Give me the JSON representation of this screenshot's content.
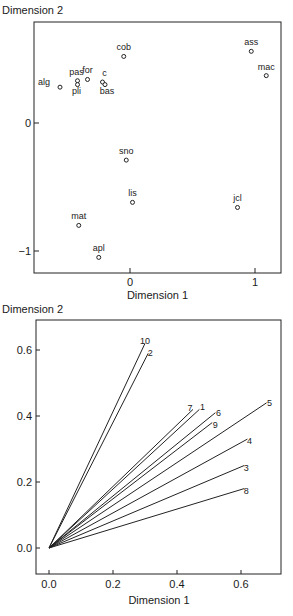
{
  "chart_data": [
    {
      "type": "scatter",
      "title": "",
      "xlabel": "Dimension 1",
      "ylabel": "Dimension 2",
      "xticks": [
        0,
        1
      ],
      "yticks": [
        0,
        -1
      ],
      "xlim": [
        -0.77,
        1.21
      ],
      "ylim": [
        -1.17,
        0.79
      ],
      "grid": false,
      "marker": "open-circle",
      "points": [
        {
          "label": "ass",
          "x": 0.97,
          "y": 0.56
        },
        {
          "label": "mac",
          "x": 1.09,
          "y": 0.37
        },
        {
          "label": "cob",
          "x": -0.05,
          "y": 0.52
        },
        {
          "label": "alg",
          "x": -0.56,
          "y": 0.28
        },
        {
          "label": "pas",
          "x": -0.42,
          "y": 0.33
        },
        {
          "label": "pli",
          "x": -0.42,
          "y": 0.3
        },
        {
          "label": "for",
          "x": -0.34,
          "y": 0.34
        },
        {
          "label": "c",
          "x": -0.22,
          "y": 0.32
        },
        {
          "label": "bas",
          "x": -0.2,
          "y": 0.3
        },
        {
          "label": "sno",
          "x": -0.03,
          "y": -0.29
        },
        {
          "label": "lis",
          "x": 0.02,
          "y": -0.62
        },
        {
          "label": "jcl",
          "x": 0.86,
          "y": -0.66
        },
        {
          "label": "mat",
          "x": -0.41,
          "y": -0.8
        },
        {
          "label": "apl",
          "x": -0.25,
          "y": -1.05
        }
      ]
    },
    {
      "type": "line",
      "subtype": "vector-plot",
      "title": "",
      "xlabel": "Dimension 1",
      "ylabel": "Dimension 2",
      "xticks": [
        0.0,
        0.2,
        0.4,
        0.6
      ],
      "xtick_labels": [
        "0.0",
        "0.2",
        "0.4",
        "0.6"
      ],
      "yticks": [
        0.0,
        0.2,
        0.4,
        0.6
      ],
      "ytick_labels": [
        "0.0",
        "0.2",
        "0.4",
        "0.6"
      ],
      "xlim": [
        -0.04,
        0.72
      ],
      "ylim": [
        -0.08,
        0.69
      ],
      "grid": false,
      "origin": [
        0,
        0
      ],
      "vectors": [
        {
          "label": "10",
          "x": 0.3,
          "y": 0.62
        },
        {
          "label": "2",
          "x": 0.31,
          "y": 0.59
        },
        {
          "label": "7",
          "x": 0.45,
          "y": 0.42
        },
        {
          "label": "1",
          "x": 0.47,
          "y": 0.42
        },
        {
          "label": "6",
          "x": 0.52,
          "y": 0.41
        },
        {
          "label": "9",
          "x": 0.51,
          "y": 0.38
        },
        {
          "label": "5",
          "x": 0.68,
          "y": 0.44
        },
        {
          "label": "4",
          "x": 0.62,
          "y": 0.33
        },
        {
          "label": "3",
          "x": 0.61,
          "y": 0.25
        },
        {
          "label": "8",
          "x": 0.61,
          "y": 0.18
        }
      ]
    }
  ]
}
